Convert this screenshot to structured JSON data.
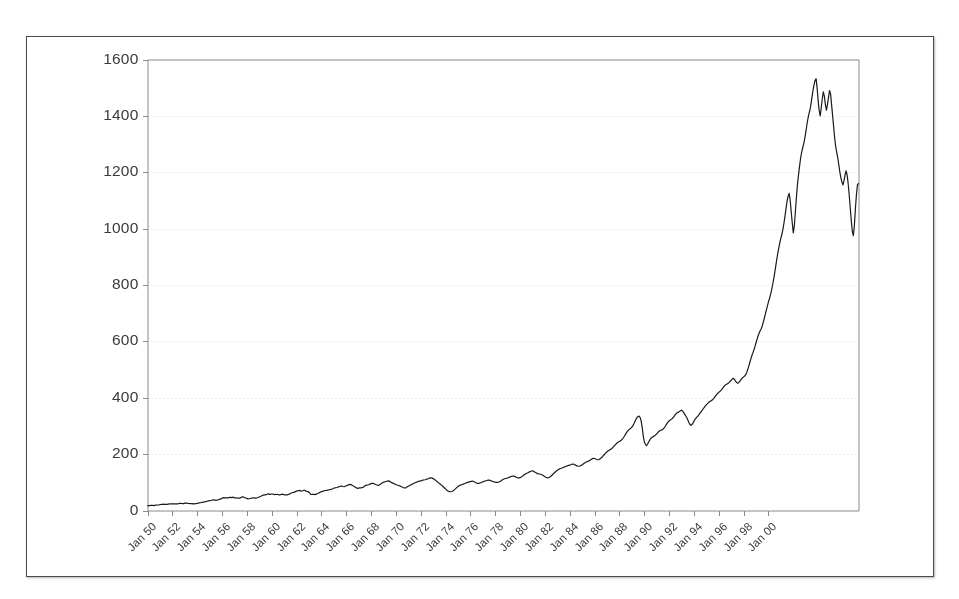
{
  "chart_data": {
    "type": "line",
    "title": "",
    "subtitle": "",
    "xlabel": "",
    "ylabel": "",
    "ylim": [
      0,
      1600
    ],
    "yticks": [
      0,
      200,
      400,
      600,
      800,
      1000,
      1200,
      1400,
      1600
    ],
    "ytick_labels": [
      "0",
      "200",
      "400",
      "600",
      "800",
      "1000",
      "1200",
      "1400",
      "1600"
    ],
    "grid": true,
    "grid_style": "dotted",
    "grid_color": "#d8d8d8",
    "legend": false,
    "legend_position": "none",
    "line_color": "#1a1a1a",
    "line_width": 1.2,
    "background_color": "#ffffff",
    "border_color": "#4a4a4a",
    "axis_color": "#8a8a8a",
    "xtick_labels": [
      "Jan 50",
      "Jan 52",
      "Jan 54",
      "Jan 56",
      "Jan 58",
      "Jan 60",
      "Jan 62",
      "Jan 64",
      "Jan 66",
      "Jan 68",
      "Jan 70",
      "Jan 72",
      "Jan 74",
      "Jan 76",
      "Jan 78",
      "Jan 80",
      "Jan 82",
      "Jan 84",
      "Jan 86",
      "Jan 88",
      "Jan 90",
      "Jan 92",
      "Jan 94",
      "Jan 96",
      "Jan 98",
      "Jan 00"
    ],
    "x_start_year": 1950,
    "x_end_year": 2001,
    "x_tick_interval_years": 2,
    "series": [
      {
        "name": "Index level",
        "x_unit": "month",
        "values": [
          16.9,
          17.2,
          17.3,
          17.9,
          18.4,
          18.6,
          17.4,
          18.4,
          19.3,
          19.5,
          19.5,
          19.8,
          20.4,
          21.4,
          21.6,
          21.9,
          22.4,
          21.7,
          21.6,
          21.9,
          22.9,
          23.3,
          23.4,
          23.4,
          23.8,
          23.8,
          23.8,
          24.0,
          23.8,
          23.4,
          24.1,
          25.0,
          25.0,
          24.8,
          24.5,
          24.5,
          26.2,
          26.2,
          25.9,
          25.0,
          24.8,
          24.1,
          24.4,
          24.6,
          23.3,
          23.5,
          24.5,
          24.7,
          24.8,
          26.0,
          26.9,
          27.6,
          28.5,
          29.1,
          29.7,
          30.6,
          31.4,
          32.0,
          33.5,
          34.2,
          34.9,
          35.6,
          36.4,
          37.6,
          37.6,
          36.9,
          36.1,
          36.9,
          38.1,
          38.5,
          40.2,
          41.2,
          43.2,
          44.8,
          45.5,
          45.1,
          45.2,
          44.8,
          44.5,
          46.4,
          46.8,
          45.6,
          46.7,
          47.4,
          44.4,
          45.0,
          45.0,
          43.5,
          44.0,
          44.1,
          45.5,
          47.4,
          48.8,
          47.3,
          45.2,
          44.2,
          43.0,
          41.2,
          41.8,
          42.4,
          43.6,
          44.1,
          44.6,
          45.2,
          44.1,
          44.0,
          45.1,
          46.0,
          48.2,
          49.7,
          51.3,
          53.5,
          54.4,
          55.2,
          55.4,
          57.0,
          58.0,
          59.6,
          57.1,
          57.5,
          58.7,
          58.5,
          57.1,
          56.5,
          57.5,
          56.8,
          56.9,
          55.6,
          55.4,
          56.8,
          57.5,
          58.1,
          55.4,
          55.8,
          55.6,
          55.4,
          56.9,
          58.1,
          60.4,
          62.1,
          63.1,
          64.1,
          65.1,
          66.9,
          68.8,
          69.6,
          70.4,
          71.3,
          69.8,
          68.8,
          70.0,
          71.6,
          71.1,
          68.8,
          67.4,
          66.8,
          65.2,
          60.9,
          56.7,
          56.9,
          57.2,
          57.6,
          56.5,
          58.0,
          59.6,
          61.0,
          63.1,
          65.1,
          66.6,
          67.7,
          68.8,
          69.9,
          71.0,
          71.5,
          72.2,
          72.7,
          73.8,
          74.8,
          76.0,
          77.3,
          78.8,
          80.2,
          80.8,
          81.7,
          83.0,
          84.1,
          85.4,
          86.9,
          86.2,
          85.1,
          84.2,
          85.9,
          87.6,
          89.1,
          90.7,
          92.0,
          92.4,
          91.6,
          88.9,
          86.8,
          85.0,
          81.3,
          80.6,
          77.9,
          79.6,
          80.4,
          80.3,
          80.7,
          82.0,
          84.5,
          87.4,
          89.6,
          90.1,
          90.5,
          92.0,
          93.6,
          95.2,
          96.5,
          96.0,
          94.7,
          93.0,
          91.2,
          90.2,
          88.8,
          90.6,
          93.4,
          96.2,
          98.7,
          100.4,
          101.3,
          102.5,
          103.8,
          104.5,
          105.1,
          103.4,
          100.7,
          98.7,
          97.2,
          95.6,
          93.5,
          92.1,
          90.5,
          89.6,
          88.2,
          87.2,
          85.0,
          83.2,
          81.4,
          80.0,
          79.9,
          81.3,
          83.9,
          86.2,
          88.1,
          89.9,
          92.0,
          93.7,
          96.0,
          97.4,
          99.1,
          100.8,
          102.2,
          103.5,
          104.4,
          105.3,
          106.2,
          107.6,
          108.2,
          109.0,
          110.0,
          111.5,
          112.7,
          114.2,
          115.5,
          116.1,
          114.9,
          113.2,
          110.5,
          108.0,
          105.2,
          102.0,
          99.0,
          96.0,
          93.2,
          90.0,
          87.0,
          83.5,
          80.0,
          76.5,
          73.0,
          70.0,
          68.0,
          67.0,
          66.5,
          67.5,
          69.5,
          72.0,
          75.0,
          78.5,
          82.0,
          85.0,
          87.5,
          89.5,
          91.0,
          92.0,
          93.5,
          95.0,
          96.5,
          98.0,
          99.5,
          100.5,
          101.5,
          102.5,
          103.5,
          104.5,
          103.0,
          101.0,
          99.0,
          97.5,
          96.5,
          96.0,
          97.0,
          98.5,
          100.0,
          101.5,
          103.0,
          104.5,
          105.5,
          106.5,
          107.5,
          108.0,
          107.0,
          105.5,
          104.0,
          102.5,
          101.5,
          100.5,
          100.0,
          99.5,
          100.5,
          102.0,
          104.0,
          106.5,
          109.0,
          111.0,
          112.5,
          113.5,
          114.5,
          115.5,
          117.0,
          118.5,
          120.0,
          121.5,
          122.5,
          122.0,
          120.5,
          118.5,
          117.0,
          116.0,
          115.5,
          116.5,
          118.5,
          121.0,
          124.0,
          127.0,
          129.5,
          131.5,
          133.0,
          135.0,
          137.0,
          138.5,
          140.0,
          141.0,
          139.5,
          137.0,
          134.5,
          132.5,
          131.0,
          130.0,
          129.5,
          128.5,
          127.0,
          125.0,
          122.5,
          120.0,
          118.0,
          116.5,
          116.0,
          117.0,
          119.5,
          122.5,
          126.0,
          129.5,
          133.0,
          136.5,
          140.0,
          143.0,
          145.5,
          147.5,
          149.0,
          150.0,
          151.5,
          153.0,
          154.5,
          156.0,
          157.5,
          159.0,
          160.0,
          161.0,
          162.5,
          164.0,
          165.0,
          164.0,
          162.0,
          160.0,
          158.5,
          157.5,
          157.0,
          158.0,
          160.0,
          162.5,
          165.0,
          167.5,
          170.0,
          172.0,
          173.5,
          175.0,
          177.0,
          179.5,
          182.0,
          184.0,
          185.5,
          184.5,
          182.5,
          181.0,
          180.0,
          180.5,
          182.5,
          185.5,
          189.0,
          193.0,
          197.0,
          201.0,
          205.0,
          208.5,
          211.5,
          214.0,
          216.0,
          218.0,
          221.0,
          225.0,
          229.0,
          233.0,
          237.0,
          240.5,
          243.0,
          245.0,
          247.0,
          250.0,
          254.0,
          259.0,
          265.0,
          271.0,
          277.0,
          282.0,
          286.0,
          289.0,
          292.0,
          296.0,
          301.0,
          308.0,
          316.0,
          324.0,
          330.0,
          333.5,
          335.0,
          330.0,
          318.0,
          295.0,
          265.0,
          245.0,
          235.0,
          230.0,
          234.0,
          241.0,
          248.0,
          254.0,
          258.0,
          261.0,
          263.0,
          265.0,
          268.0,
          272.0,
          276.0,
          280.0,
          283.0,
          285.0,
          286.0,
          288.0,
          292.0,
          297.0,
          303.0,
          309.0,
          314.0,
          318.0,
          321.0,
          323.0,
          326.0,
          330.0,
          335.0,
          340.0,
          344.0,
          347.0,
          349.0,
          351.0,
          354.0,
          356.0,
          353.0,
          348.0,
          342.0,
          336.0,
          330.0,
          322.0,
          313.0,
          306.0,
          302.0,
          304.0,
          310.0,
          317.0,
          323.0,
          328.0,
          332.0,
          336.0,
          341.0,
          346.0,
          351.0,
          356.0,
          361.0,
          366.0,
          371.0,
          375.0,
          379.0,
          383.0,
          386.0,
          388.0,
          390.0,
          393.0,
          397.0,
          402.0,
          407.0,
          412.0,
          416.0,
          419.0,
          422.0,
          426.0,
          430.0,
          435.0,
          440.0,
          444.0,
          447.0,
          449.0,
          451.0,
          454.0,
          458.0,
          462.0,
          466.0,
          469.0,
          466.0,
          460.0,
          455.0,
          452.0,
          453.0,
          457.0,
          462.0,
          467.0,
          471.0,
          474.0,
          477.0,
          482.0,
          490.0,
          500.0,
          512.0,
          525.0,
          538.0,
          550.0,
          560.0,
          570.0,
          582.0,
          595.0,
          608.0,
          620.0,
          630.0,
          638.0,
          645.0,
          655.0,
          668.0,
          682.0,
          697.0,
          712.0,
          726.0,
          740.0,
          752.0,
          766.0,
          782.0,
          800.0,
          820.0,
          842.0,
          866.0,
          890.0,
          912.0,
          932.0,
          950.0,
          966.0,
          980.0,
          998.0,
          1020.0,
          1045.0,
          1072.0,
          1098.0,
          1115.0,
          1125.0,
          1100.0,
          1060.0,
          1020.0,
          985.0,
          1010.0,
          1060.0,
          1110.0,
          1155.0,
          1190.0,
          1220.0,
          1248.0,
          1270.0,
          1286.0,
          1300.0,
          1318.0,
          1340.0,
          1365.0,
          1388.0,
          1405.0,
          1420.0,
          1440.0,
          1465.0,
          1490.0,
          1510.0,
          1525.0,
          1532.0,
          1500.0,
          1455.0,
          1420.0,
          1400.0,
          1428.0,
          1460.0,
          1485.0,
          1470.0,
          1440.0,
          1420.0,
          1440.0,
          1465.0,
          1490.0,
          1478.0,
          1440.0,
          1400.0,
          1360.0,
          1320.0,
          1290.0,
          1270.0,
          1250.0,
          1225.0,
          1200.0,
          1180.0,
          1165.0,
          1155.0,
          1170.0,
          1190.0,
          1205.0,
          1190.0,
          1160.0,
          1120.0,
          1075.0,
          1030.0,
          990.0,
          975.0,
          1010.0,
          1070.0,
          1120.0,
          1155.0,
          1160.0
        ]
      }
    ],
    "notable_points": [
      {
        "label": "start",
        "period": "Jan 1950",
        "value": 16.9
      },
      {
        "label": "1973-74 bear market trough",
        "period": "1974",
        "value": 66.5
      },
      {
        "label": "1987 peak",
        "period": "Aug 1987",
        "value": 335
      },
      {
        "label": "1987 crash trough",
        "period": "Nov 1987",
        "value": 230
      },
      {
        "label": "all-time peak",
        "period": "Mar 2000",
        "value": 1532
      },
      {
        "label": "end",
        "period": "Jan 2001",
        "value": 1160
      }
    ]
  }
}
